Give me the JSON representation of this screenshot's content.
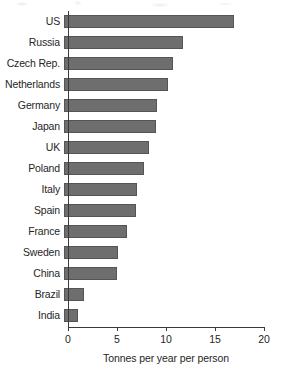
{
  "chart_data": {
    "type": "bar",
    "orientation": "horizontal",
    "title": "",
    "xlabel": "Tonnes per year per person",
    "ylabel": "",
    "xlim": [
      0,
      20
    ],
    "xticks": [
      0,
      5,
      10,
      15,
      20
    ],
    "grid": false,
    "legend": null,
    "bar_color": "#6e6e6e",
    "bar_edge_color": "#555555",
    "axis_color": "#3a3a3a",
    "categories": [
      "US",
      "Russia",
      "Czech Rep.",
      "Netherlands",
      "Germany",
      "Japan",
      "UK",
      "Poland",
      "Italy",
      "Spain",
      "France",
      "Sweden",
      "China",
      "Brazil",
      "India"
    ],
    "values": [
      17.3,
      12.1,
      11.1,
      10.6,
      9.5,
      9.4,
      8.7,
      8.2,
      7.4,
      7.3,
      6.4,
      5.5,
      5.4,
      2.0,
      1.4
    ]
  }
}
